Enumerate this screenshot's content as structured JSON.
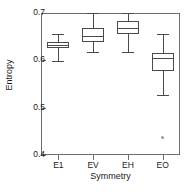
{
  "chart_data": {
    "type": "box",
    "title": "",
    "xlabel": "Symmetry",
    "ylabel": "Entropy",
    "categories": [
      "E1",
      "EV",
      "EH",
      "EO"
    ],
    "ylim": [
      0.4,
      0.7
    ],
    "yticks": [
      0.4,
      0.5,
      0.6,
      0.7
    ],
    "ytick_labels": [
      "0.4",
      "0.5",
      "0.6",
      "0.7"
    ],
    "grid": false,
    "legend": null,
    "boxes": [
      {
        "category": "E1",
        "whisker_low": 0.598,
        "q1": 0.627,
        "median": 0.632,
        "q3": 0.639,
        "whisker_high": 0.655,
        "outliers": []
      },
      {
        "category": "EV",
        "whisker_low": 0.617,
        "q1": 0.638,
        "median": 0.652,
        "q3": 0.668,
        "whisker_high": 0.7,
        "outliers": []
      },
      {
        "category": "EH",
        "whisker_low": 0.618,
        "q1": 0.655,
        "median": 0.668,
        "q3": 0.683,
        "whisker_high": 0.7,
        "outliers": []
      },
      {
        "category": "EO",
        "whisker_low": 0.526,
        "q1": 0.578,
        "median": 0.604,
        "q3": 0.615,
        "whisker_high": 0.655,
        "outliers": [
          0.437
        ]
      }
    ]
  },
  "colors": {
    "axis": "#6d6d6d",
    "box": "#4a4a4a",
    "outlier": "#9a9a9a",
    "text": "#1a1a1a",
    "background": "#ffffff"
  }
}
